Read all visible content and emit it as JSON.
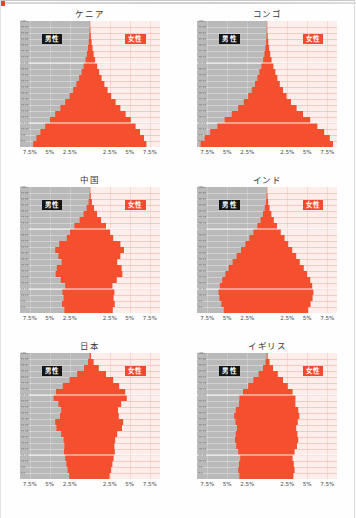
{
  "page": {
    "background_color": "#fefefe",
    "accent_color": "#f04b30",
    "male_panel_color": "#b9b9b9",
    "female_panel_color": "#fdeeec",
    "bottom_caption": ""
  },
  "legend": {
    "male_label": "男性",
    "female_label": "女性",
    "male_badge_color": "#151515",
    "female_badge_color": "#f04b30"
  },
  "axis": {
    "x_ticks": [
      "7.5%",
      "5%",
      "2.5%",
      "2.5%",
      "5%",
      "7.5%"
    ],
    "x_tick_values": [
      -7.5,
      -5,
      -2.5,
      2.5,
      5,
      7.5
    ],
    "xlim": [
      -8.75,
      8.75
    ],
    "age_groups": [
      "100+",
      "95-99",
      "90-94",
      "85-89",
      "80-84",
      "75-79",
      "70-74",
      "65-69",
      "60-64",
      "55-59",
      "50-54",
      "45-49",
      "40-44",
      "35-39",
      "30-34",
      "25-29",
      "20-24",
      "15-19",
      "10-14",
      "5-9",
      "0-4"
    ]
  },
  "chart_data": [
    {
      "type": "bar",
      "title": "ケニア",
      "xlabel": "",
      "ylabel": "",
      "orientation": "population-pyramid",
      "categories": [
        "100+",
        "95-99",
        "90-94",
        "85-89",
        "80-84",
        "75-79",
        "70-74",
        "65-69",
        "60-64",
        "55-59",
        "50-54",
        "45-49",
        "40-44",
        "35-39",
        "30-34",
        "25-29",
        "20-24",
        "15-19",
        "10-14",
        "5-9",
        "0-4"
      ],
      "series": [
        {
          "name": "男性",
          "values": [
            0.02,
            0.04,
            0.08,
            0.15,
            0.25,
            0.38,
            0.55,
            0.8,
            1.05,
            1.35,
            1.7,
            2.1,
            2.55,
            3.1,
            3.7,
            4.35,
            5.0,
            5.6,
            6.2,
            6.7,
            7.1
          ]
        },
        {
          "name": "女性",
          "values": [
            0.03,
            0.06,
            0.11,
            0.2,
            0.32,
            0.46,
            0.64,
            0.9,
            1.15,
            1.45,
            1.8,
            2.2,
            2.65,
            3.2,
            3.8,
            4.45,
            5.1,
            5.7,
            6.25,
            6.75,
            7.05
          ]
        }
      ],
      "xlim": [
        -8.75,
        8.75
      ],
      "grid": true,
      "legend_position": "inside-top"
    },
    {
      "type": "bar",
      "title": "コンゴ",
      "xlabel": "",
      "ylabel": "",
      "orientation": "population-pyramid",
      "categories": [
        "100+",
        "95-99",
        "90-94",
        "85-89",
        "80-84",
        "75-79",
        "70-74",
        "65-69",
        "60-64",
        "55-59",
        "50-54",
        "45-49",
        "40-44",
        "35-39",
        "30-34",
        "25-29",
        "20-24",
        "15-19",
        "10-14",
        "5-9",
        "0-4"
      ],
      "series": [
        {
          "name": "男性",
          "values": [
            0.02,
            0.03,
            0.06,
            0.11,
            0.2,
            0.32,
            0.48,
            0.7,
            0.95,
            1.2,
            1.5,
            1.9,
            2.35,
            2.9,
            3.6,
            4.4,
            5.3,
            6.2,
            7.1,
            7.8,
            8.3
          ]
        },
        {
          "name": "女性",
          "values": [
            0.03,
            0.05,
            0.09,
            0.16,
            0.27,
            0.4,
            0.57,
            0.8,
            1.05,
            1.3,
            1.6,
            2.0,
            2.45,
            3.0,
            3.7,
            4.5,
            5.4,
            6.3,
            7.15,
            7.85,
            8.25
          ]
        }
      ],
      "xlim": [
        -8.75,
        8.75
      ],
      "grid": true,
      "legend_position": "inside-top"
    },
    {
      "type": "bar",
      "title": "中国",
      "xlabel": "",
      "ylabel": "",
      "orientation": "population-pyramid",
      "categories": [
        "100+",
        "95-99",
        "90-94",
        "85-89",
        "80-84",
        "75-79",
        "70-74",
        "65-69",
        "60-64",
        "55-59",
        "50-54",
        "45-49",
        "40-44",
        "35-39",
        "30-34",
        "25-29",
        "20-24",
        "15-19",
        "10-14",
        "5-9",
        "0-4"
      ],
      "series": [
        {
          "name": "男性",
          "values": [
            0.02,
            0.06,
            0.18,
            0.42,
            0.8,
            1.3,
            1.95,
            2.5,
            2.9,
            3.85,
            4.35,
            3.95,
            3.55,
            4.15,
            4.3,
            3.65,
            3.1,
            3.45,
            3.3,
            3.5,
            3.2
          ]
        },
        {
          "name": "女性",
          "values": [
            0.04,
            0.1,
            0.24,
            0.5,
            0.88,
            1.38,
            2.0,
            2.5,
            2.9,
            3.8,
            4.25,
            3.8,
            3.4,
            3.95,
            4.05,
            3.35,
            2.8,
            3.05,
            2.95,
            3.1,
            2.85
          ]
        }
      ],
      "xlim": [
        -8.75,
        8.75
      ],
      "grid": true,
      "legend_position": "inside-top"
    },
    {
      "type": "bar",
      "title": "インド",
      "xlabel": "",
      "ylabel": "",
      "orientation": "population-pyramid",
      "categories": [
        "100+",
        "95-99",
        "90-94",
        "85-89",
        "80-84",
        "75-79",
        "70-74",
        "65-69",
        "60-64",
        "55-59",
        "50-54",
        "45-49",
        "40-44",
        "35-39",
        "30-34",
        "25-29",
        "20-24",
        "15-19",
        "10-14",
        "5-9",
        "0-4"
      ],
      "series": [
        {
          "name": "男性",
          "values": [
            0.02,
            0.05,
            0.12,
            0.28,
            0.5,
            0.8,
            1.2,
            1.7,
            2.2,
            2.7,
            3.25,
            3.8,
            4.3,
            4.8,
            5.2,
            5.6,
            5.9,
            6.05,
            5.95,
            5.7,
            5.4
          ]
        },
        {
          "name": "女性",
          "values": [
            0.03,
            0.07,
            0.15,
            0.32,
            0.55,
            0.85,
            1.25,
            1.72,
            2.2,
            2.65,
            3.15,
            3.65,
            4.1,
            4.6,
            5.0,
            5.4,
            5.65,
            5.8,
            5.7,
            5.45,
            5.15
          ]
        }
      ],
      "xlim": [
        -8.75,
        8.75
      ],
      "grid": true,
      "legend_position": "inside-top"
    },
    {
      "type": "bar",
      "title": "日本",
      "xlabel": "",
      "ylabel": "",
      "orientation": "population-pyramid",
      "categories": [
        "100+",
        "95-99",
        "90-94",
        "85-89",
        "80-84",
        "75-79",
        "70-74",
        "65-69",
        "60-64",
        "55-59",
        "50-54",
        "45-49",
        "40-44",
        "35-39",
        "30-34",
        "25-29",
        "20-24",
        "15-19",
        "10-14",
        "5-9",
        "0-4"
      ],
      "series": [
        {
          "name": "男性",
          "values": [
            0.05,
            0.25,
            0.75,
            1.6,
            2.55,
            3.4,
            4.25,
            4.55,
            3.95,
            3.6,
            3.75,
            4.35,
            4.2,
            3.6,
            3.3,
            3.2,
            3.25,
            3.1,
            2.95,
            2.8,
            2.6
          ]
        },
        {
          "name": "女性",
          "values": [
            0.12,
            0.45,
            1.1,
            2.0,
            2.9,
            3.65,
            4.4,
            4.6,
            3.9,
            3.5,
            3.6,
            4.15,
            4.0,
            3.4,
            3.15,
            3.05,
            3.1,
            2.95,
            2.8,
            2.65,
            2.45
          ]
        }
      ],
      "xlim": [
        -8.75,
        8.75
      ],
      "grid": true,
      "legend_position": "inside-top"
    },
    {
      "type": "bar",
      "title": "イギリス",
      "xlabel": "",
      "ylabel": "",
      "orientation": "population-pyramid",
      "categories": [
        "100+",
        "95-99",
        "90-94",
        "85-89",
        "80-84",
        "75-79",
        "70-74",
        "65-69",
        "60-64",
        "55-59",
        "50-54",
        "45-49",
        "40-44",
        "35-39",
        "30-34",
        "25-29",
        "20-24",
        "15-19",
        "10-14",
        "5-9",
        "0-4"
      ],
      "series": [
        {
          "name": "男性",
          "values": [
            0.04,
            0.18,
            0.5,
            1.05,
            1.7,
            2.35,
            3.0,
            3.45,
            3.5,
            3.9,
            4.1,
            3.95,
            3.75,
            3.9,
            4.0,
            3.85,
            3.6,
            3.35,
            3.5,
            3.6,
            3.45
          ]
        },
        {
          "name": "女性",
          "values": [
            0.09,
            0.32,
            0.75,
            1.35,
            2.0,
            2.6,
            3.2,
            3.55,
            3.55,
            3.9,
            4.05,
            3.85,
            3.65,
            3.8,
            3.9,
            3.75,
            3.45,
            3.2,
            3.35,
            3.45,
            3.3
          ]
        }
      ],
      "xlim": [
        -8.75,
        8.75
      ],
      "grid": true,
      "legend_position": "inside-top"
    }
  ]
}
